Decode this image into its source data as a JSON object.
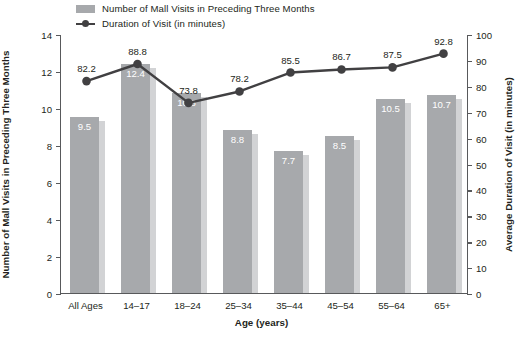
{
  "legend": {
    "items": [
      {
        "label": "Number of Mall Visits in Preceding Three Months",
        "marker": "bar-swatch-icon",
        "color": "#a7a9ac"
      },
      {
        "label": "Duration of Visit (in minutes)",
        "marker": "line-marker-icon",
        "color": "#414042"
      }
    ]
  },
  "axes": {
    "x_title": "Age (years)",
    "y_left_title": "Number of Mall Visits in Preceding Three Months",
    "y_right_title": "Average Duration of Visit (in minutes)",
    "y_left_ticks": [
      "0",
      "2",
      "4",
      "6",
      "8",
      "10",
      "12",
      "14"
    ],
    "y_right_ticks": [
      "0",
      "10",
      "20",
      "30",
      "40",
      "50",
      "60",
      "70",
      "80",
      "90",
      "100"
    ]
  },
  "chart_data": {
    "type": "bar",
    "title": "",
    "xlabel": "Age (years)",
    "ylabel": "Number of Mall Visits in Preceding Three Months",
    "y2label": "Average Duration of Visit (in minutes)",
    "categories": [
      "All Ages",
      "14–17",
      "18–24",
      "25–34",
      "35–44",
      "45–54",
      "55–64",
      "65+"
    ],
    "ylim": [
      0,
      14
    ],
    "y2lim": [
      0,
      100
    ],
    "grid": false,
    "legend_position": "top",
    "series": [
      {
        "name": "Number of Mall Visits in Preceding Three Months",
        "type": "bar",
        "axis": "left",
        "color": "#a7a9ac",
        "values": [
          9.5,
          12.4,
          10.8,
          8.8,
          7.7,
          8.5,
          10.5,
          10.7
        ],
        "labels": [
          "9.5",
          "12.4",
          "10.8",
          "8.8",
          "7.7",
          "8.5",
          "10.5",
          "10.7"
        ]
      },
      {
        "name": "Duration of Visit (in minutes)",
        "type": "line",
        "axis": "right",
        "color": "#414042",
        "values": [
          82.2,
          88.8,
          73.8,
          78.2,
          85.5,
          86.7,
          87.5,
          92.8
        ],
        "labels": [
          "82.2",
          "88.8",
          "73.8",
          "78.2",
          "85.5",
          "86.7",
          "87.5",
          "92.8"
        ]
      }
    ]
  }
}
